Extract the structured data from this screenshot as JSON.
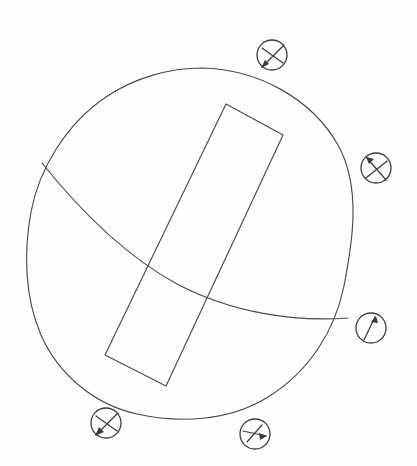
{
  "figure": {
    "title": "Hand-drawn sphere with cutting plane and tabular body",
    "background_color": "#fefefe",
    "line_color": "#4a4a4e",
    "marker_color": "#3b3b3f",
    "width": 417,
    "height": 466
  },
  "sphere": {
    "label": "sphere-outline",
    "center_x": 188,
    "center_y": 243,
    "radius_x": 161,
    "radius_y": 175
  },
  "plane": {
    "label": "great-circle-plane",
    "start_x": 42,
    "start_y": 163,
    "end_x": 348,
    "end_y": 318
  },
  "tabular_body": {
    "label": "tabular-block",
    "corners": [
      {
        "x": 226,
        "y": 104
      },
      {
        "x": 283,
        "y": 135
      },
      {
        "x": 166,
        "y": 386
      },
      {
        "x": 105,
        "y": 355
      }
    ]
  },
  "markers": [
    {
      "id": "marker-top",
      "name": "shear-sense-top",
      "glyph": "arrow-down-left-crossed",
      "cx": 272,
      "cy": 55,
      "r": 15,
      "arrow_angle_deg": 205,
      "has_cross_bar": true,
      "has_arrow_head": true
    },
    {
      "id": "marker-right-upper",
      "name": "shear-sense-right-upper",
      "glyph": "arrow-up-left-crossed",
      "cx": 376,
      "cy": 168,
      "r": 15,
      "arrow_angle_deg": 145,
      "has_cross_bar": true,
      "has_arrow_head": true
    },
    {
      "id": "marker-right-lower",
      "name": "lineation-right-lower",
      "glyph": "arrow-up-right-plain",
      "cx": 371,
      "cy": 328,
      "r": 15,
      "arrow_angle_deg": 70,
      "has_cross_bar": false,
      "has_arrow_head": true
    },
    {
      "id": "marker-bottom-left",
      "name": "shear-sense-bottom-left",
      "glyph": "arrow-down-left-crossed",
      "cx": 106,
      "cy": 423,
      "r": 15,
      "arrow_angle_deg": 205,
      "has_cross_bar": true,
      "has_arrow_head": true
    },
    {
      "id": "marker-bottom-right",
      "name": "shear-sense-bottom-right",
      "glyph": "arrow-right-crossed",
      "cx": 255,
      "cy": 434,
      "r": 15,
      "arrow_angle_deg": 355,
      "has_cross_bar": true,
      "has_arrow_head": true
    }
  ]
}
